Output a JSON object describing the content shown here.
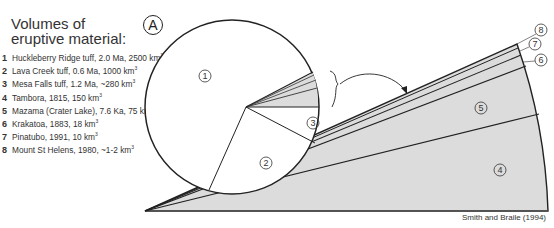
{
  "title": {
    "line1": "Volumes of",
    "line2": "eruptive material:"
  },
  "panel_label": "A",
  "legend": [
    {
      "num": "1",
      "text": "Huckleberry Ridge tuff, 2.0 Ma, 2500 km",
      "sup": "3"
    },
    {
      "num": "2",
      "text": "Lava Creek tuff, 0.6 Ma, 1000 km",
      "sup": "3"
    },
    {
      "num": "3",
      "text": "Mesa Falls tuff, 1.2 Ma, ~280 km",
      "sup": "3"
    },
    {
      "num": "4",
      "text": "Tambora, 1815, 150 km",
      "sup": "3"
    },
    {
      "num": "5",
      "text": "Mazama (Crater Lake), 7.6 Ka, 75 km",
      "sup": "3"
    },
    {
      "num": "6",
      "text": "Krakatoa, 1883, 18 km",
      "sup": "3"
    },
    {
      "num": "7",
      "text": "Pinatubo, 1991, 10 km",
      "sup": "3"
    },
    {
      "num": "8",
      "text": "Mount St Helens, 1980, ~1-2 km",
      "sup": "3"
    }
  ],
  "pie_labels": {
    "one": "1",
    "two": "2",
    "three": "3"
  },
  "wedge_labels": {
    "four": "4",
    "five": "5",
    "six": "6",
    "seven": "7",
    "eight": "8"
  },
  "credit": "Smith and Braile (1994)",
  "colors": {
    "outline": "#222222",
    "fill_gray": "#dcdcdc",
    "background": "#ffffff"
  }
}
